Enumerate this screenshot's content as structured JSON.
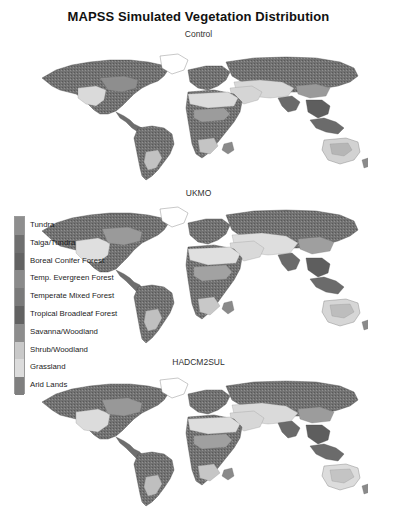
{
  "figure": {
    "title": "MAPSS Simulated Vegetation Distribution",
    "background_color": "#ffffff"
  },
  "panels": [
    {
      "id": "control",
      "title": "Control"
    },
    {
      "id": "ukmo",
      "title": "UKMO"
    },
    {
      "id": "hadcm2sul",
      "title": "HADCM2SUL"
    }
  ],
  "legend": {
    "items": [
      {
        "label": "Tundra",
        "color": "#8e8e8e"
      },
      {
        "label": "Taiga/Tundra",
        "color": "#6f6f6f"
      },
      {
        "label": "Boreal Conifer Forest",
        "color": "#636363"
      },
      {
        "label": "Temp. Evergreen Forest",
        "color": "#8a8a8a"
      },
      {
        "label": "Temperate Mixed Forest",
        "color": "#7a7a7a"
      },
      {
        "label": "Tropical Broadleaf Forest",
        "color": "#626262"
      },
      {
        "label": "Savanna/Woodland",
        "color": "#8d8d8d"
      },
      {
        "label": "Shrub/Woodland",
        "color": "#c9c9c9"
      },
      {
        "label": "Grassland",
        "color": "#dcdcdc"
      },
      {
        "label": "Arid Lands",
        "color": "#7f7f7f"
      }
    ]
  },
  "chart_data": {
    "type": "heatmap",
    "title": "MAPSS Simulated Vegetation Distribution",
    "subtitle": "",
    "xlabel": "",
    "ylabel": "",
    "grid": false,
    "legend_position": "left-middle",
    "panels": [
      "Control",
      "UKMO",
      "HADCM2SUL"
    ],
    "categories": [
      "Tundra",
      "Taiga/Tundra",
      "Boreal Conifer Forest",
      "Temp. Evergreen Forest",
      "Temperate Mixed Forest",
      "Tropical Broadleaf Forest",
      "Savanna/Woodland",
      "Shrub/Woodland",
      "Grassland",
      "Arid Lands"
    ],
    "values": [
      1,
      2,
      3,
      4,
      5,
      6,
      7,
      8,
      9,
      10
    ],
    "colors": [
      "#8e8e8e",
      "#6f6f6f",
      "#636363",
      "#8a8a8a",
      "#7a7a7a",
      "#626262",
      "#8d8d8d",
      "#c9c9c9",
      "#dcdcdc",
      "#7f7f7f"
    ],
    "projection": "global equirectangular world map",
    "note": "Three grayscale global maps of MAPSS simulated vegetation classes under a Control climate and two GCM scenarios (UKMO, HADCM2SUL)."
  }
}
